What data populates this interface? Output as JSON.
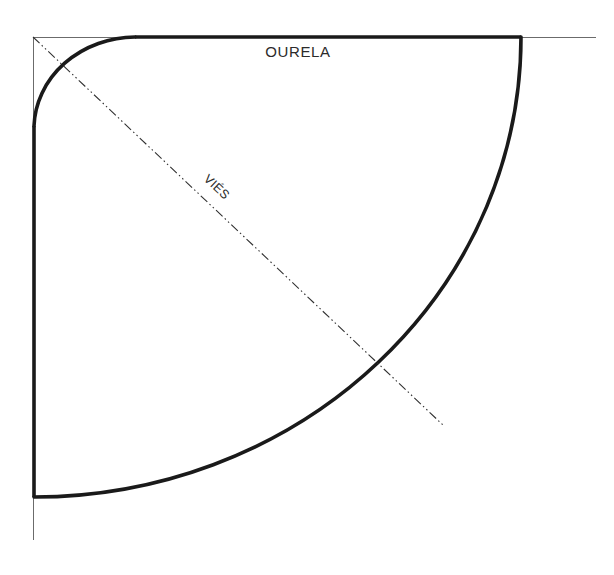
{
  "diagram": {
    "background_color": "#ffffff",
    "ink_color": "#1a1a1a",
    "thin_line_color": "#6b6b6b",
    "labels": {
      "selvage": "OURELA",
      "bias": "VIÉS"
    },
    "geometry": {
      "corner_x": 33,
      "corner_y": 37,
      "top_thick_end_x": 520,
      "top_thin_end_x": 596,
      "left_thick_end_y": 497,
      "left_thin_end_y": 540,
      "small_arc_radius": 102,
      "large_arc_radius": 487,
      "bias_line_end_x": 443,
      "bias_line_end_y": 425,
      "bias_angle_deg": 45
    },
    "strokes": {
      "thick_width": 3.6,
      "thin_width": 1.0,
      "bias_width": 1.1,
      "bias_dash_pattern": "9 3 1.5 3 1.5 3"
    }
  }
}
